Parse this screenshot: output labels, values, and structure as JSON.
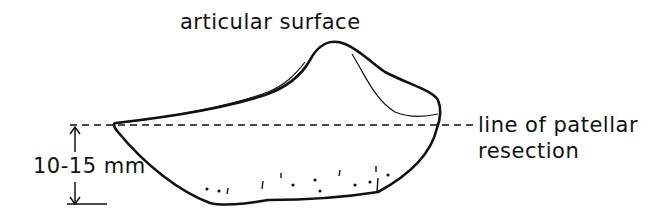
{
  "diagram": {
    "labels": {
      "articular_surface": "articular surface",
      "resection_line_1": "line of patellar",
      "resection_line_2": "resection",
      "thickness": "10-15 mm"
    },
    "colors": {
      "ink": "#111111",
      "background": "#ffffff"
    }
  }
}
